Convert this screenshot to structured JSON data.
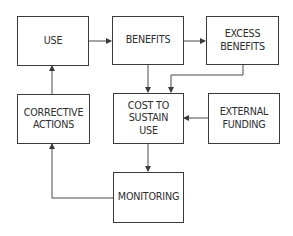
{
  "diagram": {
    "type": "flowchart",
    "nodes": [
      {
        "id": "use",
        "label": "USE"
      },
      {
        "id": "benefits",
        "label": "BENEFITS"
      },
      {
        "id": "excess_benefits",
        "label": "EXCESS\nBENEFITS"
      },
      {
        "id": "cost_to_sustain_use",
        "label": "COST TO\nSUSTAIN\nUSE"
      },
      {
        "id": "external_funding",
        "label": "EXTERNAL\nFUNDING"
      },
      {
        "id": "corrective_actions",
        "label": "CORRECTIVE\nACTIONS"
      },
      {
        "id": "monitoring",
        "label": "MONITORING"
      }
    ],
    "edges": [
      {
        "from": "use",
        "to": "benefits"
      },
      {
        "from": "benefits",
        "to": "excess_benefits"
      },
      {
        "from": "benefits",
        "to": "cost_to_sustain_use"
      },
      {
        "from": "excess_benefits",
        "to": "cost_to_sustain_use"
      },
      {
        "from": "external_funding",
        "to": "cost_to_sustain_use"
      },
      {
        "from": "cost_to_sustain_use",
        "to": "monitoring"
      },
      {
        "from": "monitoring",
        "to": "corrective_actions"
      },
      {
        "from": "corrective_actions",
        "to": "use"
      }
    ],
    "colors": {
      "stroke": "#3a3a3a",
      "text": "#2e2e2e",
      "background": "#ffffff"
    }
  }
}
